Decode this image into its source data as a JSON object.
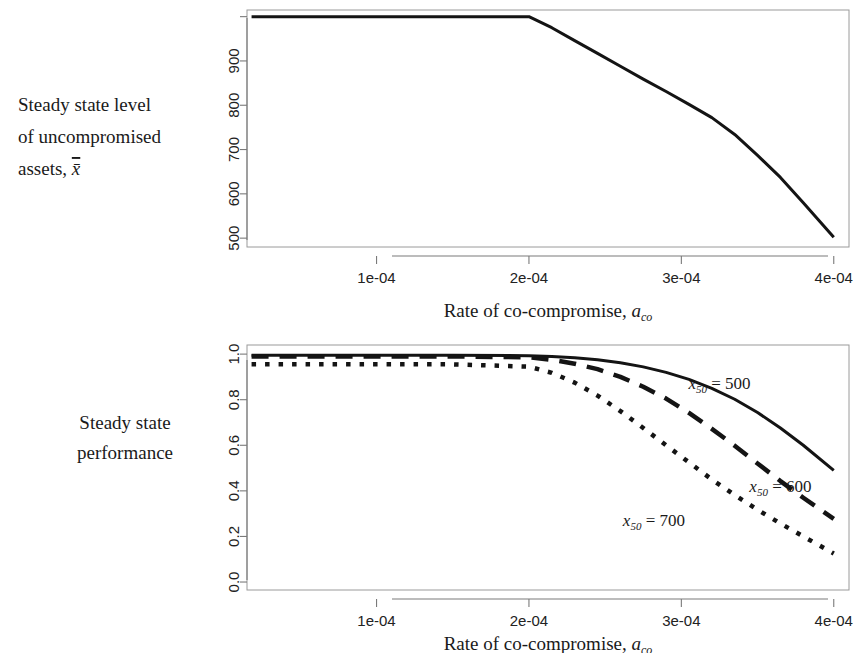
{
  "figure": {
    "panels": [
      {
        "id": "top",
        "side_label_lines": [
          "Steady state level",
          "of uncompromised",
          "assets, x̄"
        ],
        "xaxis_title_main": "Rate of co-compromise, ",
        "xaxis_title_var": "a",
        "xaxis_title_sub": "co"
      },
      {
        "id": "bottom",
        "side_label_lines": [
          "Steady state",
          "performance"
        ],
        "xaxis_title_main": "Rate of co-compromise, ",
        "xaxis_title_var": "a",
        "xaxis_title_sub": "co"
      }
    ]
  },
  "chart_data": [
    {
      "id": "steady-state-assets",
      "type": "line",
      "title": "",
      "xlabel": "Rate of co-compromise, a_co",
      "ylabel": "Steady state level of uncompromised assets, x̄",
      "xlim": [
        1.5e-05,
        0.00041
      ],
      "ylim": [
        480,
        1015
      ],
      "xticks": [
        0.0001,
        0.0002,
        0.0003,
        0.0004
      ],
      "xticklabels": [
        "1e-04",
        "2e-04",
        "3e-04",
        "4e-04"
      ],
      "yticks": [
        500,
        600,
        700,
        800,
        900,
        1000
      ],
      "yticklabels": [
        "500",
        "600",
        "700",
        "800",
        "900",
        ""
      ],
      "grid": false,
      "legend": "none",
      "series": [
        {
          "name": "xbar",
          "linestyle": "solid",
          "linewidth": 3,
          "color": "#141414",
          "x": [
            1.8e-05,
            5e-05,
            0.0001,
            0.00015,
            0.0002,
            0.000215,
            0.00023,
            0.000245,
            0.00026,
            0.000275,
            0.00029,
            0.000305,
            0.00032,
            0.000335,
            0.00035,
            0.000365,
            0.00038,
            0.0004
          ],
          "y": [
            1000,
            1000,
            1000,
            1000,
            1000,
            975,
            946,
            917,
            888,
            859,
            831,
            802,
            772,
            734,
            687,
            637,
            580,
            502
          ]
        }
      ]
    },
    {
      "id": "steady-state-performance",
      "type": "line",
      "title": "",
      "xlabel": "Rate of co-compromise, a_co",
      "ylabel": "Steady state performance",
      "xlim": [
        1.5e-05,
        0.00041
      ],
      "ylim": [
        -0.035,
        1.04
      ],
      "xticks": [
        0.0001,
        0.0002,
        0.0003,
        0.0004
      ],
      "xticklabels": [
        "1e-04",
        "2e-04",
        "3e-04",
        "4e-04"
      ],
      "yticks": [
        0.0,
        0.2,
        0.4,
        0.6,
        0.8,
        1.0
      ],
      "yticklabels": [
        "0.0",
        "0.2",
        "0.4",
        "0.6",
        "0.8",
        "1.0"
      ],
      "grid": false,
      "legend": "annotations",
      "annotations": [
        {
          "text_var": "x",
          "text_sub": "50",
          "text_eq": " = 500",
          "x": 0.000325,
          "y": 0.845
        },
        {
          "text_var": "x",
          "text_sub": "50",
          "text_eq": " = 600",
          "x": 0.000365,
          "y": 0.395
        },
        {
          "text_var": "x",
          "text_sub": "50",
          "text_eq": " = 700",
          "x": 0.000282,
          "y": 0.245
        }
      ],
      "series": [
        {
          "name": "x50 = 500",
          "linestyle": "solid",
          "linewidth": 3,
          "color": "#141414",
          "x": [
            1.8e-05,
            5e-05,
            0.0001,
            0.00015,
            0.0002,
            0.000215,
            0.00023,
            0.000245,
            0.00026,
            0.000275,
            0.00029,
            0.000305,
            0.00032,
            0.000335,
            0.00035,
            0.000365,
            0.00038,
            0.0004
          ],
          "y": [
            0.995,
            0.995,
            0.995,
            0.995,
            0.993,
            0.99,
            0.984,
            0.975,
            0.962,
            0.944,
            0.92,
            0.889,
            0.85,
            0.802,
            0.744,
            0.676,
            0.6,
            0.49
          ]
        },
        {
          "name": "x50 = 600",
          "linestyle": "dashed",
          "linewidth": 4.5,
          "color": "#141414",
          "x": [
            1.8e-05,
            5e-05,
            0.0001,
            0.00015,
            0.0002,
            0.000215,
            0.00023,
            0.000245,
            0.00026,
            0.000275,
            0.00029,
            0.000305,
            0.00032,
            0.000335,
            0.00035,
            0.000365,
            0.00038,
            0.0004
          ],
          "y": [
            0.99,
            0.99,
            0.99,
            0.99,
            0.986,
            0.975,
            0.958,
            0.934,
            0.9,
            0.857,
            0.805,
            0.742,
            0.672,
            0.598,
            0.52,
            0.443,
            0.37,
            0.277
          ]
        },
        {
          "name": "x50 = 700",
          "linestyle": "dotted",
          "linewidth": 4.5,
          "color": "#141414",
          "x": [
            1.8e-05,
            5e-05,
            0.0001,
            0.00015,
            0.0002,
            0.000215,
            0.00023,
            0.000245,
            0.00026,
            0.000275,
            0.00029,
            0.000305,
            0.00032,
            0.000335,
            0.00035,
            0.000365,
            0.00038,
            0.0004
          ],
          "y": [
            0.955,
            0.955,
            0.955,
            0.955,
            0.945,
            0.918,
            0.875,
            0.818,
            0.75,
            0.676,
            0.6,
            0.525,
            0.45,
            0.382,
            0.317,
            0.257,
            0.2,
            0.125
          ]
        }
      ]
    }
  ]
}
